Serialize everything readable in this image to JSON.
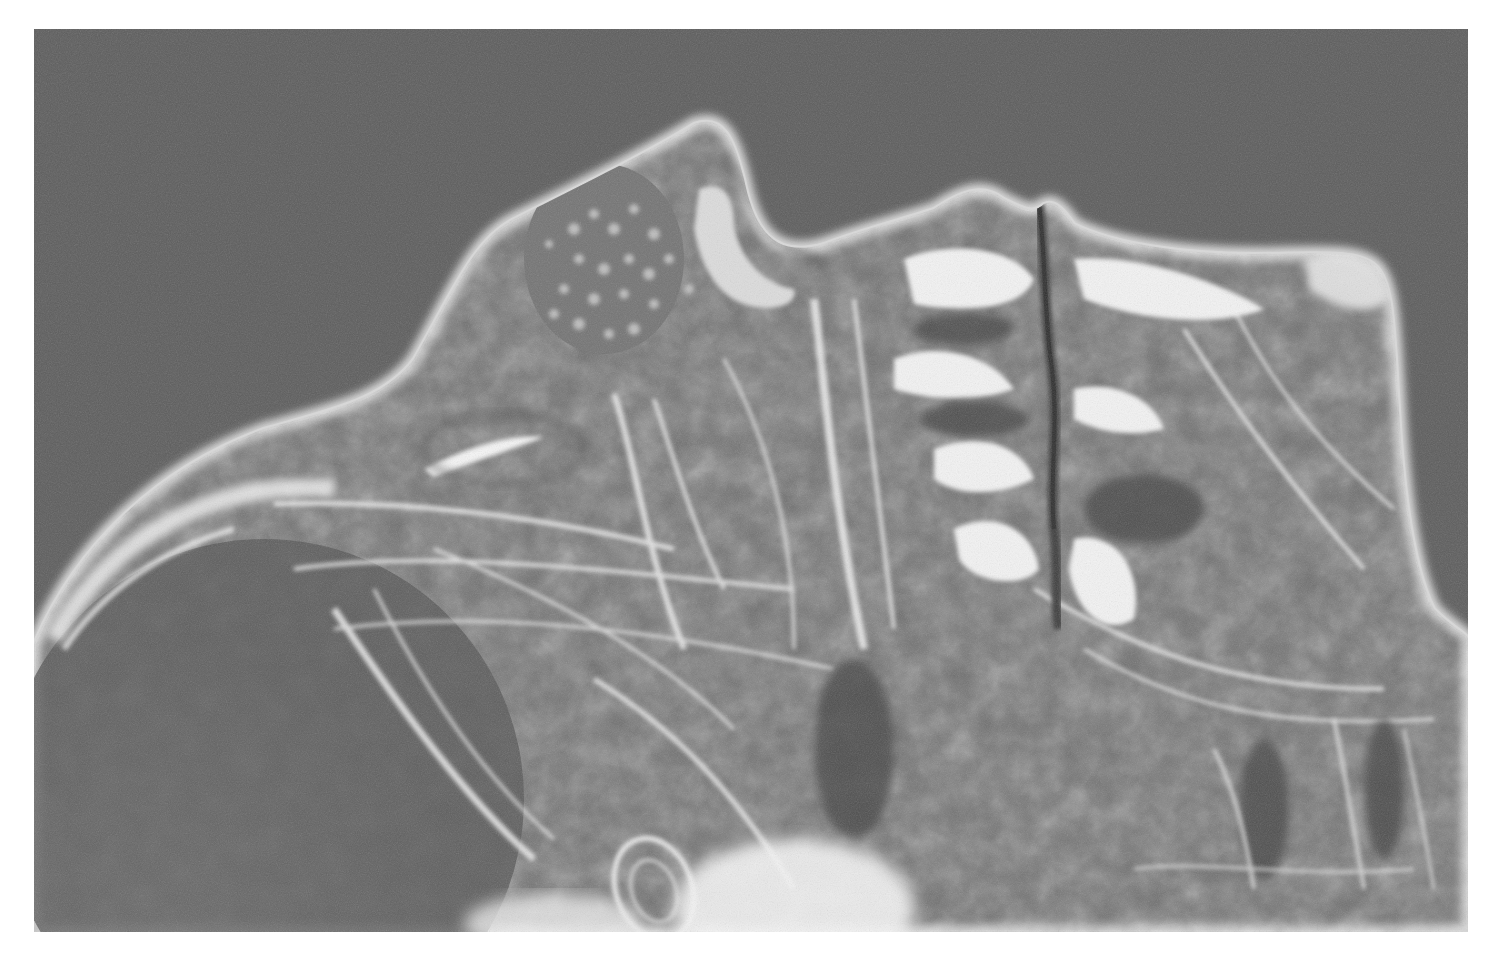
{
  "figure": {
    "type": "grayscale radiograph",
    "caption": "",
    "frame": {
      "x": 34,
      "y": 29,
      "width": 1434,
      "height": 903
    },
    "colors": {
      "page_background": "#ffffff",
      "image_background": "#5c5c5c",
      "tissue_mid": "#7a7a7a",
      "tissue_dark": "#4e4e4e",
      "highlight": "#f4f4f4",
      "fissure": "#3e3e3e"
    },
    "regions": [
      {
        "name": "left-lobe-outline",
        "description": "bright rounded outer contour on left"
      },
      {
        "name": "granular-cap",
        "description": "speckled granular area near top-left peak"
      },
      {
        "name": "central-fissure",
        "description": "dark vertical crack through center-right"
      },
      {
        "name": "right-lobe",
        "description": "bright fibrous region on right"
      },
      {
        "name": "ring-structure",
        "description": "oval ring near bottom center"
      }
    ]
  }
}
